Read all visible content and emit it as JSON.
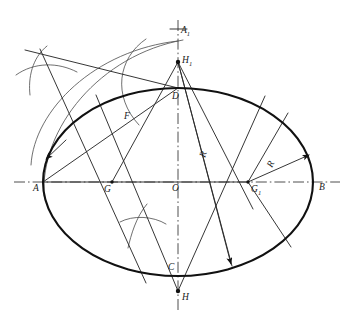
{
  "figure": {
    "type": "geometric-construction",
    "width": 353,
    "height": 324,
    "background_color": "#ffffff",
    "ink_color": "#111111",
    "construction_color": "#4a4a4a"
  },
  "labels": {
    "a_left": "A",
    "b_right": "B",
    "a1_top": "A",
    "a1_sub": "1",
    "h1_top": "H",
    "h1_sub": "1",
    "h_bottom": "H",
    "d_top": "D",
    "c_bottom": "C",
    "o_center": "O",
    "g_left": "G",
    "g1_right": "G",
    "g1_sub": "1",
    "f_point": "F",
    "radius_small": "R",
    "radius_large": "R"
  },
  "geometry": {
    "center": {
      "x": 178,
      "y": 182
    },
    "semi_major": 135,
    "semi_minor": 94,
    "major_axis_endpoints": [
      {
        "name": "A",
        "x": 43,
        "y": 182
      },
      {
        "name": "B",
        "x": 313,
        "y": 182
      }
    ],
    "minor_axis_endpoints": [
      {
        "name": "D",
        "x": 178,
        "y": 88
      },
      {
        "name": "C",
        "x": 178,
        "y": 276
      }
    ],
    "centres": [
      {
        "name": "G",
        "x": 112,
        "y": 182
      },
      {
        "name": "G1",
        "x": 248,
        "y": 182
      },
      {
        "name": "H1",
        "x": 178,
        "y": 62
      },
      {
        "name": "H",
        "x": 178,
        "y": 291
      }
    ],
    "auxiliary_points": [
      {
        "name": "A1",
        "x": 178,
        "y": 27
      },
      {
        "name": "F",
        "x": 133,
        "y": 116
      },
      {
        "name": "O",
        "x": 178,
        "y": 182
      }
    ],
    "arc_crossings": [
      {
        "name": "upper-left-bisector-cross",
        "x": 42,
        "y": 68
      },
      {
        "name": "lower-middle-bisector-cross",
        "x": 140,
        "y": 225
      }
    ]
  }
}
